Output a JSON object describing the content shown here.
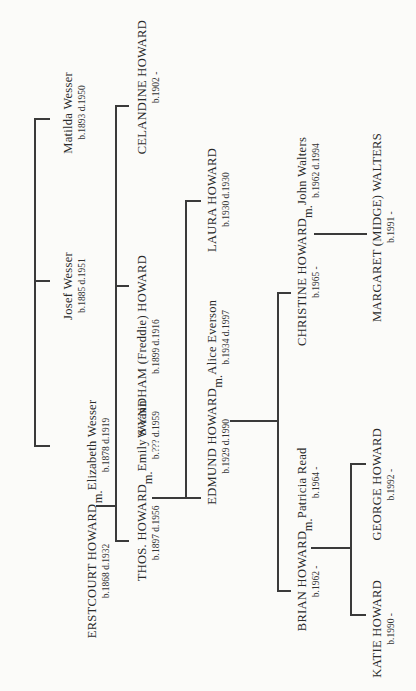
{
  "tree": {
    "gen1": {
      "couple": {
        "husband": {
          "name": "ERSTCOURT HOWARD",
          "dates": "b.1868 d.1932"
        },
        "marriage": "m.",
        "wife": {
          "name": "Elizabeth Wesser",
          "dates": "b.1878 d.1919"
        }
      },
      "wife_siblings": [
        {
          "name": "Josef Wesser",
          "dates": "b.1885 d.1951"
        },
        {
          "name": "Matilda Wesser",
          "dates": "b.1893 d.1950"
        }
      ]
    },
    "gen2": {
      "couple": {
        "husband": {
          "name": "THOS. HOWARD",
          "dates": "b.1897 d.1956"
        },
        "marriage": "m.",
        "wife": {
          "name": "Emily Swann",
          "dates": "b.??? d.1959"
        }
      },
      "siblings": [
        {
          "name": "WYNDHAM (Freddie) HOWARD",
          "dates": "b.1899 d.1916"
        },
        {
          "name": "CELANDINE HOWARD",
          "dates": "b.1902 -"
        }
      ]
    },
    "gen3": {
      "couple": {
        "husband": {
          "name": "EDMUND HOWARD",
          "dates": "b.1929 d.1990"
        },
        "marriage": "m.",
        "wife": {
          "name": "Alice Everson",
          "dates": "b.1934 d.1997"
        }
      },
      "siblings": [
        {
          "name": "LAURA HOWARD",
          "dates": "b.1930 d.1930"
        }
      ]
    },
    "gen4": {
      "couple1": {
        "husband": {
          "name": "BRIAN HOWARD",
          "dates": "b.1962 -"
        },
        "marriage": "m.",
        "wife": {
          "name": "Patricia Read",
          "dates": "b.1964 -"
        }
      },
      "couple2": {
        "wife": {
          "name": "CHRISTINE HOWARD",
          "dates": "b.1965 -"
        },
        "marriage": "m.",
        "husband": {
          "name": "John Walters",
          "dates": "b.1962 d.1994"
        }
      }
    },
    "gen5": {
      "brian_children": [
        {
          "name": "KATIE HOWARD",
          "dates": "b.1990 -"
        },
        {
          "name": "GEORGE HOWARD",
          "dates": "b.1992 -"
        }
      ],
      "christine_children": [
        {
          "name": "MARGARET (MIDGE) WALTERS",
          "dates": "b.1991 -"
        }
      ]
    }
  }
}
